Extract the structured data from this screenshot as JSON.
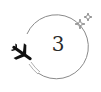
{
  "badge": {
    "number": "3",
    "icons": {
      "orbit": "circle-orbit-icon",
      "plane": "airplane-icon",
      "sparkles": "sparkle-stars-icon"
    },
    "colors": {
      "stroke": "#8a8a8a",
      "plane": "#111111",
      "text": "#2a2a2a",
      "background": "#ffffff"
    }
  }
}
